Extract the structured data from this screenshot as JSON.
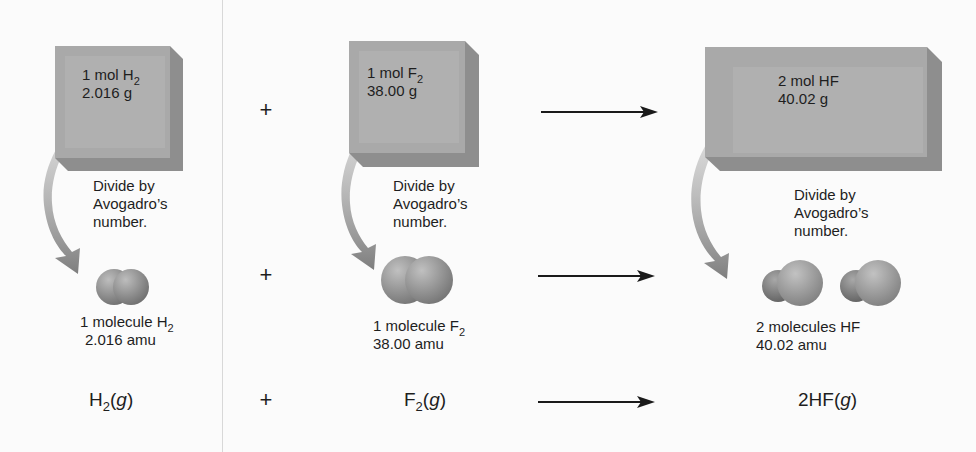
{
  "columns": [
    {
      "id": "h2",
      "box": {
        "line1": "1 mol H",
        "line1_sub": "2",
        "line2": "2.016 g"
      },
      "note": [
        "Divide by",
        "Avogadro’s",
        "number."
      ],
      "molecule": {
        "label": "1 molecule H",
        "label_sub": "2",
        "mass": "2.016 amu"
      },
      "equation": {
        "formula": "H",
        "sub": "2",
        "state": "g"
      }
    },
    {
      "id": "f2",
      "box": {
        "line1": "1 mol F",
        "line1_sub": "2",
        "line2": "38.00 g"
      },
      "note": [
        "Divide by",
        "Avogadro’s",
        "number."
      ],
      "molecule": {
        "label": "1 molecule F",
        "label_sub": "2",
        "mass": "38.00 amu"
      },
      "equation": {
        "formula": "F",
        "sub": "2",
        "state": "g"
      }
    },
    {
      "id": "hf",
      "box": {
        "line1": "2 mol HF",
        "line2": "40.02 g"
      },
      "note": [
        "Divide by",
        "Avogadro’s",
        "number."
      ],
      "molecule": {
        "label": "2 molecules HF",
        "mass": "40.02 amu"
      },
      "equation": {
        "formula": "2HF",
        "state": "g"
      }
    }
  ],
  "operators": {
    "plus": "+",
    "open_paren": "(",
    "close_paren": ")"
  },
  "colors": {
    "box_front": "#a9a9a9",
    "box_inner": "#b4b4b4",
    "box_side": "#8e8e8e",
    "box_bottom": "#8a8a8a",
    "curve_arrow": "#8c8c8c",
    "molecule_light": "#b3b3b3",
    "molecule_dark": "#6f6f6f",
    "arrow": "#1a1a1a",
    "text": "#1e1e1e"
  }
}
